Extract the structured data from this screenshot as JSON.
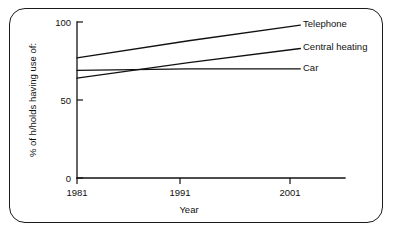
{
  "figure": {
    "border_color": "#1a1a1a",
    "background_color": "#ffffff",
    "line_color": "#111111"
  },
  "chart_data": {
    "type": "line",
    "title": "",
    "xlabel": "Year",
    "ylabel": "% of h/holds having use of:",
    "x": [
      1981,
      1991,
      2001
    ],
    "xlim": [
      1981,
      2005
    ],
    "ylim": [
      0,
      100
    ],
    "xticks": [
      1981,
      1991,
      2001
    ],
    "xtick_labels": [
      "1981",
      "1991",
      "2001"
    ],
    "yticks": [
      0,
      50,
      100
    ],
    "ytick_labels": [
      "0",
      "50",
      "100"
    ],
    "grid": false,
    "legend_position": "right-inline",
    "series": [
      {
        "name": "Telephone",
        "label": "Telephone",
        "values": [
          77,
          88,
          98
        ]
      },
      {
        "name": "Central heating",
        "label": "Central heating",
        "values": [
          64,
          74,
          83
        ]
      },
      {
        "name": "Car",
        "label": "Car",
        "values": [
          69,
          70,
          70
        ]
      }
    ]
  }
}
